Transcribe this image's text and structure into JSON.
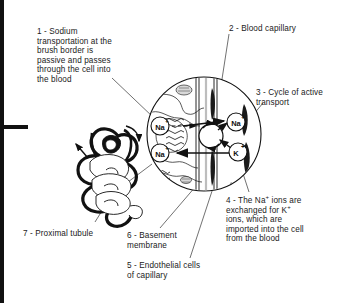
{
  "diagram": {
    "labels": [
      {
        "id": "label-1",
        "number": "1",
        "text": "1 - Sodium\ntransportation at the\nbrush border is\npassive and passes\nthrough the cell into\nthe blood"
      },
      {
        "id": "label-2",
        "number": "2",
        "text": "2 - Blood capillary"
      },
      {
        "id": "label-3",
        "number": "3",
        "text": "3 - Cycle of active\ntransport"
      },
      {
        "id": "label-4",
        "number": "4",
        "text_line1": "4 - The Na",
        "text_sup1": "+",
        "text_line1b": " ions are",
        "text_line2": "exchanged for K",
        "text_sup2": "+",
        "text_line3": "ions, which are",
        "text_line4": "imported into the cell",
        "text_line5": "from the blood"
      },
      {
        "id": "label-5",
        "number": "5",
        "text": "5 - Endothelial cells\nof capillary"
      },
      {
        "id": "label-6",
        "number": "6",
        "text": "6 - Basement\nmembrane"
      },
      {
        "id": "label-7",
        "number": "7",
        "text": "7 - Proximal tubule"
      }
    ],
    "ion_markers": [
      {
        "id": "ion-na-left-upper",
        "symbol": "Na",
        "charge": "+"
      },
      {
        "id": "ion-na-left-lower",
        "symbol": "Na",
        "charge": "+"
      },
      {
        "id": "ion-na-right",
        "symbol": "Na",
        "charge": "+"
      },
      {
        "id": "ion-k-right",
        "symbol": "K",
        "charge": "+"
      }
    ],
    "colors": {
      "ink": "#111111",
      "background": "#ffffff",
      "text": "#1a1a1a"
    }
  }
}
